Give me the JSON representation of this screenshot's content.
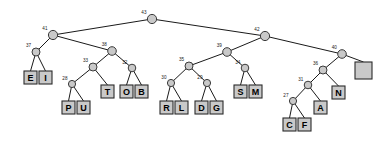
{
  "figure": {
    "type": "binary-tree",
    "background_color": "#ffffff",
    "node_fill_color": "#c9c9c9",
    "node_stroke_color": "#3a3a3a",
    "edge_color": "#1a1a1a",
    "leaf_fill_color": "#c9c9c9",
    "leaf_stroke_color": "#2b2b2b"
  },
  "tree": {
    "internal_nodes": [
      {
        "id": "n43",
        "label": "43",
        "x": 152,
        "y": 19,
        "r": 4.6
      },
      {
        "id": "n41",
        "label": "41",
        "x": 53,
        "y": 35,
        "r": 4.6
      },
      {
        "id": "n42",
        "label": "42",
        "x": 265,
        "y": 36,
        "r": 4.6
      },
      {
        "id": "n37",
        "label": "37",
        "x": 36,
        "y": 52,
        "r": 4.0
      },
      {
        "id": "n38",
        "label": "38",
        "x": 112,
        "y": 51,
        "r": 4.3
      },
      {
        "id": "n39",
        "label": "39",
        "x": 227,
        "y": 52,
        "r": 4.3
      },
      {
        "id": "n40",
        "label": "40",
        "x": 342,
        "y": 54,
        "r": 4.3
      },
      {
        "id": "n33",
        "label": "33",
        "x": 93,
        "y": 67,
        "r": 4.0
      },
      {
        "id": "n32",
        "label": "32",
        "x": 132,
        "y": 68,
        "r": 3.8
      },
      {
        "id": "n35",
        "label": "35",
        "x": 189,
        "y": 66,
        "r": 4.0
      },
      {
        "id": "n34",
        "label": "34",
        "x": 245,
        "y": 68,
        "r": 3.8
      },
      {
        "id": "n36",
        "label": "36",
        "x": 323,
        "y": 70,
        "r": 4.0
      },
      {
        "id": "n28",
        "label": "28",
        "x": 72,
        "y": 84,
        "r": 3.6
      },
      {
        "id": "n30",
        "label": "30",
        "x": 171,
        "y": 83,
        "r": 3.6
      },
      {
        "id": "n29",
        "label": "29",
        "x": 207,
        "y": 83,
        "r": 3.6
      },
      {
        "id": "n31",
        "label": "31",
        "x": 308,
        "y": 85,
        "r": 3.8
      },
      {
        "id": "n27",
        "label": "27",
        "x": 293,
        "y": 101,
        "r": 3.6
      }
    ],
    "leaves": [
      {
        "id": "lE",
        "label": "E",
        "x": 24,
        "y": 71,
        "w": 13,
        "h": 13
      },
      {
        "id": "lI",
        "label": "I",
        "x": 39,
        "y": 71,
        "w": 13,
        "h": 13
      },
      {
        "id": "lP",
        "label": "P",
        "x": 62,
        "y": 101,
        "w": 13,
        "h": 13
      },
      {
        "id": "lU",
        "label": "U",
        "x": 77,
        "y": 101,
        "w": 13,
        "h": 13
      },
      {
        "id": "lT",
        "label": "T",
        "x": 101,
        "y": 85,
        "w": 13,
        "h": 13
      },
      {
        "id": "lO",
        "label": "O",
        "x": 120,
        "y": 85,
        "w": 13,
        "h": 13
      },
      {
        "id": "lB",
        "label": "B",
        "x": 135,
        "y": 85,
        "w": 13,
        "h": 13
      },
      {
        "id": "lR",
        "label": "R",
        "x": 160,
        "y": 101,
        "w": 13,
        "h": 13
      },
      {
        "id": "lL",
        "label": "L",
        "x": 175,
        "y": 101,
        "w": 13,
        "h": 13
      },
      {
        "id": "lD",
        "label": "D",
        "x": 195,
        "y": 101,
        "w": 13,
        "h": 13
      },
      {
        "id": "lG",
        "label": "G",
        "x": 210,
        "y": 101,
        "w": 13,
        "h": 13
      },
      {
        "id": "lS",
        "label": "S",
        "x": 234,
        "y": 85,
        "w": 13,
        "h": 13
      },
      {
        "id": "lM",
        "label": "M",
        "x": 249,
        "y": 85,
        "w": 13,
        "h": 13
      },
      {
        "id": "lC",
        "label": "C",
        "x": 283,
        "y": 118,
        "w": 13,
        "h": 13
      },
      {
        "id": "lF",
        "label": "F",
        "x": 298,
        "y": 118,
        "w": 13,
        "h": 13
      },
      {
        "id": "lA",
        "label": "A",
        "x": 314,
        "y": 101,
        "w": 13,
        "h": 13
      },
      {
        "id": "lN",
        "label": "N",
        "x": 332,
        "y": 86,
        "w": 13,
        "h": 13
      },
      {
        "id": "lSPACE",
        "label": "",
        "x": 355,
        "y": 62,
        "w": 17,
        "h": 17
      }
    ],
    "edges": [
      {
        "from": "n43",
        "to": "n41"
      },
      {
        "from": "n43",
        "to": "n42"
      },
      {
        "from": "n41",
        "to": "n37"
      },
      {
        "from": "n41",
        "to": "n38"
      },
      {
        "from": "n37",
        "to": "lE"
      },
      {
        "from": "n37",
        "to": "lI"
      },
      {
        "from": "n38",
        "to": "n33"
      },
      {
        "from": "n38",
        "to": "n32"
      },
      {
        "from": "n33",
        "to": "n28"
      },
      {
        "from": "n33",
        "to": "lT"
      },
      {
        "from": "n28",
        "to": "lP"
      },
      {
        "from": "n28",
        "to": "lU"
      },
      {
        "from": "n32",
        "to": "lO"
      },
      {
        "from": "n32",
        "to": "lB"
      },
      {
        "from": "n42",
        "to": "n39"
      },
      {
        "from": "n42",
        "to": "n40"
      },
      {
        "from": "n39",
        "to": "n35"
      },
      {
        "from": "n39",
        "to": "n34"
      },
      {
        "from": "n35",
        "to": "n30"
      },
      {
        "from": "n35",
        "to": "n29"
      },
      {
        "from": "n30",
        "to": "lR"
      },
      {
        "from": "n30",
        "to": "lL"
      },
      {
        "from": "n29",
        "to": "lD"
      },
      {
        "from": "n29",
        "to": "lG"
      },
      {
        "from": "n34",
        "to": "lS"
      },
      {
        "from": "n34",
        "to": "lM"
      },
      {
        "from": "n40",
        "to": "n36"
      },
      {
        "from": "n40",
        "to": "lSPACE"
      },
      {
        "from": "n36",
        "to": "n31"
      },
      {
        "from": "n36",
        "to": "lN"
      },
      {
        "from": "n31",
        "to": "n27"
      },
      {
        "from": "n31",
        "to": "lA"
      },
      {
        "from": "n27",
        "to": "lC"
      },
      {
        "from": "n27",
        "to": "lF"
      }
    ]
  }
}
